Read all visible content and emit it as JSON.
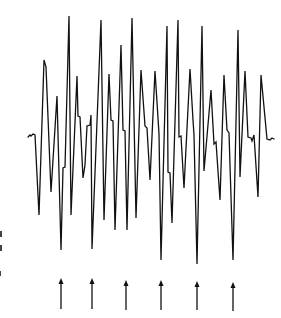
{
  "figure": {
    "ink_color": "#111111",
    "background": "#ffffff"
  },
  "waveform": {
    "points": [
      [
        28,
        137
      ],
      [
        30,
        135
      ],
      [
        31,
        136
      ],
      [
        33,
        134
      ],
      [
        35,
        135
      ],
      [
        39,
        215
      ],
      [
        44,
        60
      ],
      [
        46,
        67
      ],
      [
        51,
        192
      ],
      [
        57,
        96
      ],
      [
        61,
        250
      ],
      [
        63,
        168
      ],
      [
        65,
        167
      ],
      [
        69,
        16
      ],
      [
        71,
        215
      ],
      [
        77,
        76
      ],
      [
        78,
        116
      ],
      [
        80,
        117
      ],
      [
        83,
        178
      ],
      [
        85,
        165
      ],
      [
        87,
        126
      ],
      [
        90,
        125
      ],
      [
        91,
        115
      ],
      [
        92,
        249
      ],
      [
        101,
        20
      ],
      [
        104,
        220
      ],
      [
        109,
        74
      ],
      [
        111,
        120
      ],
      [
        113,
        121
      ],
      [
        115,
        230
      ],
      [
        121,
        45
      ],
      [
        123,
        130
      ],
      [
        125,
        131
      ],
      [
        127,
        230
      ],
      [
        132,
        18
      ],
      [
        136,
        218
      ],
      [
        141,
        70
      ],
      [
        145,
        126
      ],
      [
        147,
        128
      ],
      [
        150,
        180
      ],
      [
        155,
        71
      ],
      [
        158,
        118
      ],
      [
        159,
        134
      ],
      [
        161,
        260
      ],
      [
        167,
        26
      ],
      [
        168,
        172
      ],
      [
        170,
        173
      ],
      [
        172,
        223
      ],
      [
        178,
        20
      ],
      [
        179,
        137
      ],
      [
        181,
        136
      ],
      [
        184,
        188
      ],
      [
        190,
        69
      ],
      [
        193,
        120
      ],
      [
        194,
        135
      ],
      [
        197,
        264
      ],
      [
        202,
        26
      ],
      [
        204,
        171
      ],
      [
        211,
        90
      ],
      [
        214,
        144
      ],
      [
        216,
        142
      ],
      [
        220,
        200
      ],
      [
        224,
        75
      ],
      [
        227,
        130
      ],
      [
        229,
        133
      ],
      [
        233,
        260
      ],
      [
        238,
        30
      ],
      [
        240,
        177
      ],
      [
        245,
        71
      ],
      [
        248,
        137
      ],
      [
        251,
        138
      ],
      [
        252,
        141
      ],
      [
        254,
        135
      ],
      [
        258,
        197
      ],
      [
        261,
        75
      ],
      [
        267,
        139
      ],
      [
        270,
        140
      ],
      [
        272,
        138
      ],
      [
        274,
        139
      ]
    ]
  },
  "arrows": [
    {
      "x": 61,
      "top": 278,
      "bottom": 309
    },
    {
      "x": 92,
      "top": 278,
      "bottom": 309
    },
    {
      "x": 126,
      "top": 280,
      "bottom": 310
    },
    {
      "x": 161,
      "top": 280,
      "bottom": 310
    },
    {
      "x": 197,
      "top": 281,
      "bottom": 310
    },
    {
      "x": 233,
      "top": 282,
      "bottom": 311
    }
  ],
  "edge_marks": [
    {
      "x": 0,
      "y": 231,
      "w": 2,
      "h": 6
    },
    {
      "x": 0,
      "y": 245,
      "w": 2,
      "h": 6
    },
    {
      "x": 0,
      "y": 271,
      "w": 1,
      "h": 5
    }
  ]
}
